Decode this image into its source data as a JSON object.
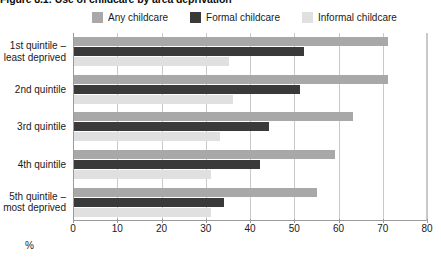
{
  "figure": {
    "title": "Figure 8.1: Use of childcare by area deprivation"
  },
  "legend": {
    "position": "top",
    "items": [
      {
        "label": "Any childcare",
        "color": "#a8a8a8",
        "name": "any-childcare"
      },
      {
        "label": "Formal childcare",
        "color": "#3a3a3a",
        "name": "formal-childcare"
      },
      {
        "label": "Informal childcare",
        "color": "#e0e0e0",
        "name": "informal-childcare"
      }
    ]
  },
  "axis": {
    "x_title": "%",
    "x_ticks": [
      "0",
      "10",
      "20",
      "30",
      "40",
      "50",
      "60",
      "70",
      "80"
    ]
  },
  "chart_data": {
    "type": "bar",
    "orientation": "horizontal",
    "title": "Figure 8.1: Use of childcare by area deprivation",
    "xlabel": "%",
    "ylabel": "",
    "xlim": [
      0,
      80
    ],
    "xticks": [
      0,
      10,
      20,
      30,
      40,
      50,
      60,
      70,
      80
    ],
    "grid": true,
    "legend_position": "top",
    "categories": [
      "1st quintile – least deprived",
      "2nd quintile",
      "3rd quintile",
      "4th quintile",
      "5th quintile – most deprived"
    ],
    "series": [
      {
        "name": "Any childcare",
        "color": "#a8a8a8",
        "values": [
          71,
          71,
          63,
          59,
          55
        ]
      },
      {
        "name": "Formal childcare",
        "color": "#3a3a3a",
        "values": [
          52,
          51,
          44,
          42,
          34
        ]
      },
      {
        "name": "Informal childcare",
        "color": "#e0e0e0",
        "values": [
          35,
          36,
          33,
          31,
          31
        ]
      }
    ]
  }
}
